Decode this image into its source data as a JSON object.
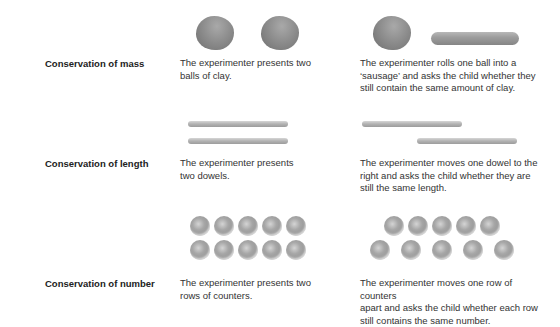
{
  "rows": [
    {
      "label": "Conservation of mass",
      "before": "The experimenter presents two balls of clay.",
      "before_lines": [
        "The experimenter presents two",
        "balls of clay."
      ],
      "after_lines": [
        "The experimenter rolls one ball into a",
        "‘sausage’ and asks the child whether they",
        "still contain the same amount of clay."
      ],
      "illustration_before": "two-clay-balls",
      "illustration_after": "clay-ball-and-sausage"
    },
    {
      "label": "Conservation of length",
      "before_lines": [
        "The experimenter presents",
        "two dowels."
      ],
      "after_lines": [
        "The experimenter moves one dowel to the",
        "right and asks the child whether they are",
        "still the same length."
      ],
      "illustration_before": "two-aligned-dowels",
      "illustration_after": "offset-dowels"
    },
    {
      "label": "Conservation of number",
      "before_lines": [
        "The experimenter presents two",
        "rows of counters."
      ],
      "after_lines": [
        "The experimenter moves one row of counters",
        "apart and asks the child whether each row",
        "still contains the same number."
      ],
      "illustration_before": "two-rows-of-five-counters",
      "illustration_after": "spread-row-of-counters",
      "counters_per_row": 5
    }
  ]
}
